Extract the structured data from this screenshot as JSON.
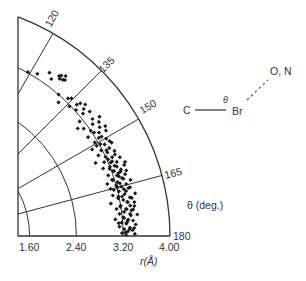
{
  "chart_data": {
    "type": "scatter",
    "subtype": "polar-quadrant",
    "title": "",
    "xlabel": "r(Å)",
    "theta_label": "θ (deg.)",
    "r_ticks": [
      "1.60",
      "2.40",
      "3.20",
      "4.00"
    ],
    "r_tick_values": [
      1.6,
      2.4,
      3.2,
      4.0
    ],
    "theta_ticks": [
      "120",
      "135",
      "150",
      "165",
      "180"
    ],
    "theta_tick_values": [
      120,
      135,
      150,
      165,
      180
    ],
    "rlim": [
      1.6,
      4.0
    ],
    "thetalim": [
      110.5,
      180
    ],
    "grid": true,
    "marker_color": "#1a1a1a",
    "line_color": "#333333",
    "points_r_theta": [
      [
        3.21,
        119.3
      ],
      [
        3.27,
        122.0
      ],
      [
        3.4,
        124.8
      ],
      [
        3.33,
        126.3
      ],
      [
        3.45,
        127.6
      ],
      [
        3.42,
        128.2
      ],
      [
        3.48,
        128.0
      ],
      [
        3.44,
        129.1
      ],
      [
        3.46,
        129.6
      ],
      [
        3.52,
        129.0
      ],
      [
        3.2,
        130.9
      ],
      [
        3.1,
        132.5
      ],
      [
        3.26,
        133.8
      ],
      [
        3.3,
        134.5
      ],
      [
        3.18,
        135.8
      ],
      [
        3.29,
        137.0
      ],
      [
        3.35,
        137.4
      ],
      [
        3.22,
        138.0
      ],
      [
        3.4,
        138.6
      ],
      [
        3.33,
        139.3
      ],
      [
        3.27,
        140.2
      ],
      [
        3.38,
        141.0
      ],
      [
        3.14,
        141.4
      ],
      [
        3.04,
        142.8
      ],
      [
        3.34,
        143.2
      ],
      [
        3.46,
        143.9
      ],
      [
        3.29,
        144.5
      ],
      [
        3.4,
        145.0
      ],
      [
        3.2,
        145.8
      ],
      [
        3.36,
        146.4
      ],
      [
        3.1,
        147.0
      ],
      [
        3.3,
        147.6
      ],
      [
        3.42,
        148.2
      ],
      [
        3.25,
        148.9
      ],
      [
        3.15,
        149.5
      ],
      [
        3.35,
        150.2
      ],
      [
        3.22,
        150.8
      ],
      [
        3.05,
        151.0
      ],
      [
        3.28,
        151.5
      ],
      [
        3.4,
        152.0
      ],
      [
        3.18,
        152.6
      ],
      [
        3.32,
        153.1
      ],
      [
        3.1,
        153.6
      ],
      [
        3.26,
        154.0
      ],
      [
        3.38,
        154.5
      ],
      [
        3.2,
        155.0
      ],
      [
        3.0,
        155.4
      ],
      [
        3.3,
        155.9
      ],
      [
        3.14,
        156.3
      ],
      [
        3.42,
        156.8
      ],
      [
        3.24,
        157.2
      ],
      [
        3.34,
        157.7
      ],
      [
        3.08,
        158.0
      ],
      [
        3.28,
        158.5
      ],
      [
        3.18,
        158.9
      ],
      [
        3.44,
        159.3
      ],
      [
        3.22,
        159.8
      ],
      [
        3.36,
        160.2
      ],
      [
        3.12,
        160.6
      ],
      [
        3.3,
        161.0
      ],
      [
        3.26,
        161.5
      ],
      [
        3.4,
        161.9
      ],
      [
        3.16,
        162.3
      ],
      [
        3.33,
        162.7
      ],
      [
        3.06,
        163.1
      ],
      [
        3.24,
        163.5
      ],
      [
        3.46,
        163.9
      ],
      [
        3.2,
        164.3
      ],
      [
        3.37,
        164.7
      ],
      [
        3.28,
        165.1
      ],
      [
        3.14,
        165.5
      ],
      [
        3.42,
        165.9
      ],
      [
        3.22,
        166.3
      ],
      [
        3.34,
        166.7
      ],
      [
        3.1,
        167.1
      ],
      [
        3.3,
        167.5
      ],
      [
        3.48,
        167.9
      ],
      [
        3.18,
        168.3
      ],
      [
        3.38,
        168.7
      ],
      [
        3.26,
        169.1
      ],
      [
        3.04,
        169.5
      ],
      [
        3.32,
        169.9
      ],
      [
        3.44,
        170.3
      ],
      [
        3.2,
        170.7
      ],
      [
        3.36,
        171.1
      ],
      [
        3.12,
        171.5
      ],
      [
        3.28,
        171.9
      ],
      [
        3.4,
        172.3
      ],
      [
        3.24,
        172.7
      ],
      [
        3.16,
        173.1
      ],
      [
        3.34,
        173.5
      ],
      [
        3.46,
        173.9
      ],
      [
        3.22,
        174.3
      ],
      [
        3.08,
        174.7
      ],
      [
        3.3,
        175.1
      ],
      [
        3.38,
        175.5
      ],
      [
        3.18,
        175.9
      ],
      [
        3.26,
        176.3
      ],
      [
        3.42,
        176.7
      ],
      [
        3.14,
        177.1
      ],
      [
        3.32,
        177.5
      ],
      [
        3.22,
        177.9
      ],
      [
        3.36,
        178.3
      ],
      [
        3.28,
        178.7
      ],
      [
        3.18,
        179.1
      ],
      [
        3.4,
        179.4
      ],
      [
        3.25,
        179.7
      ],
      [
        3.22,
        156.0
      ],
      [
        3.27,
        157.0
      ],
      [
        3.31,
        159.0
      ],
      [
        3.24,
        160.0
      ],
      [
        3.29,
        162.0
      ],
      [
        3.35,
        163.0
      ],
      [
        3.27,
        164.0
      ],
      [
        3.31,
        166.0
      ],
      [
        3.25,
        168.0
      ],
      [
        3.33,
        170.0
      ],
      [
        3.29,
        172.0
      ],
      [
        3.35,
        174.0
      ],
      [
        3.27,
        176.0
      ],
      [
        3.31,
        178.0
      ],
      [
        3.21,
        165.0
      ],
      [
        3.39,
        166.0
      ],
      [
        3.19,
        171.0
      ],
      [
        3.37,
        172.5
      ],
      [
        3.23,
        174.5
      ],
      [
        3.41,
        169.0
      ],
      [
        3.17,
        162.5
      ],
      [
        3.44,
        161.0
      ],
      [
        3.2,
        158.3
      ],
      [
        3.36,
        155.5
      ],
      [
        3.15,
        150.7
      ],
      [
        3.3,
        149.0
      ],
      [
        3.38,
        151.3
      ],
      [
        3.23,
        146.8
      ],
      [
        3.12,
        144.0
      ],
      [
        3.45,
        147.0
      ],
      [
        3.26,
        153.3
      ],
      [
        3.34,
        160.8
      ],
      [
        3.19,
        167.8
      ],
      [
        3.29,
        175.4
      ],
      [
        3.24,
        178.9
      ],
      [
        3.39,
        177.7
      ],
      [
        3.13,
        176.0
      ],
      [
        3.43,
        171.4
      ],
      [
        3.09,
        164.9
      ],
      [
        3.47,
        158.6
      ]
    ]
  },
  "diagram": {
    "atom_left": "C",
    "atom_center": "Br",
    "atom_right": "O, N",
    "angle_symbol": "θ"
  }
}
